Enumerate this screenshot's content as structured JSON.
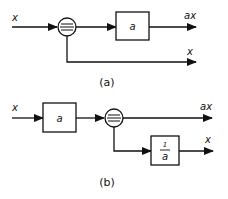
{
  "diagram_a": {
    "caption": "(a)",
    "input_label": "x",
    "gain_block_label": "a",
    "output_top_label": "ax",
    "output_bottom_label": "x",
    "node": "pickoff-point"
  },
  "diagram_b": {
    "caption": "(b)",
    "input_label": "x",
    "gain_block_label": "a",
    "inverse_block_numerator": "1",
    "inverse_block_denominator": "a",
    "output_top_label": "ax",
    "output_bottom_label": "x",
    "node": "pickoff-point"
  }
}
